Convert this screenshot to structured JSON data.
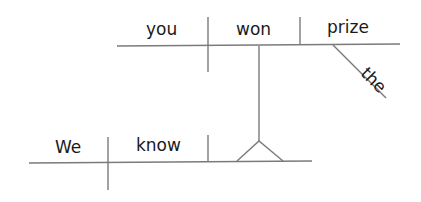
{
  "diagram": {
    "type": "reed-kellogg sentence diagram",
    "sentence_words": [
      "We",
      "know",
      "you",
      "won",
      "the",
      "prize"
    ],
    "main_clause": {
      "subject": "We",
      "verb": "know"
    },
    "noun_clause": {
      "subject": "you",
      "verb": "won",
      "direct_object": "prize",
      "modifier": "the"
    },
    "line_color": "#7a7a7a",
    "text_color": "#1a1a1a"
  }
}
